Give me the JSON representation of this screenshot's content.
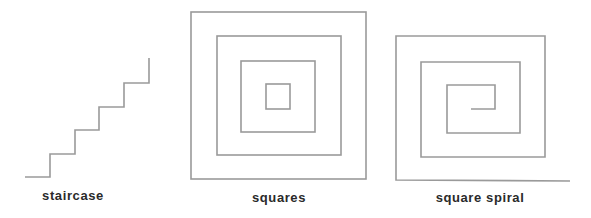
{
  "colors": {
    "stroke": "#9a9a9a",
    "label": "#2a2a2a",
    "background": "#ffffff"
  },
  "figures": [
    {
      "id": "staircase",
      "label": "staircase"
    },
    {
      "id": "squares",
      "label": "squares"
    },
    {
      "id": "square-spiral",
      "label": "square spiral"
    }
  ]
}
